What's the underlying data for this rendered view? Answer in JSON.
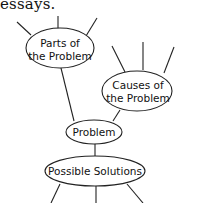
{
  "caption": "essays.",
  "nodes": {
    "parts": {
      "line1": "Parts of",
      "line2": "the Problem"
    },
    "causes": {
      "line1": "Causes of",
      "line2": "the Problem"
    },
    "problem": {
      "label": "Problem"
    },
    "solutions": {
      "label": "Possible Solutions"
    }
  },
  "colors": {
    "stroke": "#222222",
    "background": "#ffffff"
  }
}
